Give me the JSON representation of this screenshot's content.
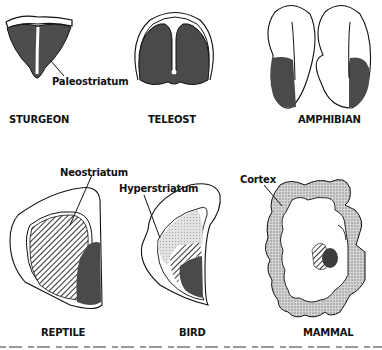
{
  "figure": {
    "panels": [
      {
        "id": "sturgeon",
        "caption": "STURGEON",
        "label": "Paleostriatum"
      },
      {
        "id": "teleost",
        "caption": "TELEOST"
      },
      {
        "id": "amphibian",
        "caption": "AMPHIBIAN"
      },
      {
        "id": "reptile",
        "caption": "REPTILE",
        "label": "Neostriatum"
      },
      {
        "id": "bird",
        "caption": "BIRD",
        "label": "Hyperstriatum"
      },
      {
        "id": "mammal",
        "caption": "MAMMAL",
        "label": "Cortex"
      }
    ],
    "legend_fills": {
      "paleostriatum": "dark solid gray",
      "neostriatum": "diagonal hatching",
      "hyperstriatum": "light stipple",
      "cortex": "stippled"
    },
    "colors": {
      "dark_fill": "#4a4a4a",
      "stipple": "#bdbdbd",
      "line": "#111111"
    }
  }
}
